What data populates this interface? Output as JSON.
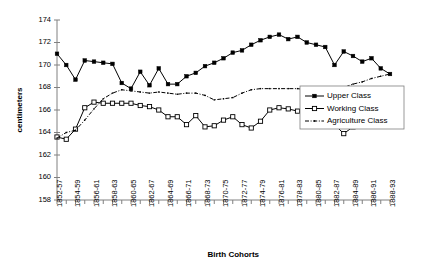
{
  "chart_data": {
    "type": "line",
    "title": "",
    "xlabel": "Birth Cohorts",
    "ylabel": "centimeters",
    "ylim": [
      158,
      174
    ],
    "ytickstep": 2,
    "yticks": [
      158,
      160,
      162,
      164,
      166,
      168,
      170,
      172,
      174
    ],
    "grid": false,
    "legend_position": "right",
    "categories": [
      "1852-57",
      "1853-58",
      "1854-59",
      "1855-60",
      "1856-61",
      "1857-62",
      "1858-63",
      "1859-64",
      "1860-65",
      "1861-66",
      "1862-67",
      "1863-68",
      "1864-69",
      "1865-70",
      "1866-71",
      "1867-72",
      "1868-73",
      "1869-74",
      "1870-75",
      "1871-76",
      "1872-77",
      "1873-78",
      "1874-79",
      "1875-80",
      "1876-81",
      "1877-82",
      "1878-83",
      "1879-84",
      "1880-85",
      "1881-86",
      "1882-87",
      "1883-88",
      "1884-89",
      "1885-90",
      "1886-91",
      "1887-92",
      "1888-93"
    ],
    "xtick_labels": [
      "1852-57",
      "1854-59",
      "1856-61",
      "1858-63",
      "1860-65",
      "1862-67",
      "1864-69",
      "1866-71",
      "1868-73",
      "1870-75",
      "1872-77",
      "1874-79",
      "1876-81",
      "1878-83",
      "1880-85",
      "1882-87",
      "1884-89",
      "1886-91",
      "1888-93"
    ],
    "series": [
      {
        "name": "Upper Class",
        "marker": "filled-square",
        "linestyle": "solid",
        "values": [
          171.0,
          170.0,
          168.7,
          170.4,
          170.3,
          170.2,
          170.1,
          168.4,
          167.9,
          169.4,
          168.2,
          169.7,
          168.3,
          168.3,
          169.0,
          169.3,
          169.9,
          170.2,
          170.6,
          171.1,
          171.3,
          171.8,
          172.2,
          172.5,
          172.7,
          172.3,
          172.5,
          172.0,
          171.8,
          171.6,
          170.0,
          171.2,
          170.8,
          170.3,
          170.6,
          169.7,
          169.2
        ]
      },
      {
        "name": "Working Class",
        "marker": "open-square",
        "linestyle": "solid",
        "values": [
          163.6,
          163.4,
          164.3,
          166.2,
          166.7,
          166.6,
          166.6,
          166.6,
          166.6,
          166.4,
          166.3,
          166.0,
          165.4,
          165.4,
          164.7,
          165.5,
          164.5,
          164.6,
          165.1,
          165.4,
          164.7,
          164.4,
          165.0,
          166.0,
          166.2,
          166.1,
          165.9,
          165.7,
          165.4,
          165.2,
          164.7,
          163.9,
          164.5,
          165.7,
          166.0,
          166.1,
          166.3
        ]
      },
      {
        "name": "Agriculture Class",
        "marker": "small-dot",
        "linestyle": "dash-dot",
        "values": [
          163.5,
          164.0,
          164.2,
          165.1,
          166.1,
          167.0,
          167.5,
          167.8,
          167.7,
          167.6,
          167.5,
          167.6,
          167.5,
          167.4,
          167.5,
          167.5,
          167.3,
          166.9,
          167.0,
          167.1,
          167.5,
          167.8,
          167.9,
          167.9,
          167.9,
          167.9,
          167.9,
          167.8,
          167.6,
          167.6,
          167.8,
          168.0,
          168.3,
          168.5,
          168.8,
          169.0,
          169.2
        ]
      }
    ]
  },
  "legend": {
    "items": [
      {
        "label": "Upper Class"
      },
      {
        "label": "Working Class"
      },
      {
        "label": "Agriculture Class"
      }
    ]
  }
}
